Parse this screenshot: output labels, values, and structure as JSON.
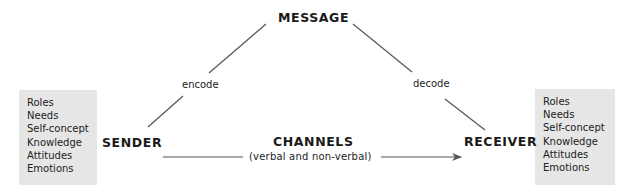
{
  "diagram": {
    "nodes": {
      "message": "MESSAGE",
      "sender": "SENDER",
      "receiver": "RECEIVER",
      "channels": "CHANNELS",
      "channels_subtitle": "(verbal and non-verbal)"
    },
    "edges": {
      "encode": "encode",
      "decode": "decode"
    },
    "sender_attributes": [
      "Roles",
      "Needs",
      "Self-concept",
      "Knowledge",
      "Attitudes",
      "Emotions"
    ],
    "receiver_attributes": [
      "Roles",
      "Needs",
      "Self-concept",
      "Knowledge",
      "Attitudes",
      "Emotions"
    ],
    "colors": {
      "box_fill": "#e6e6e6",
      "line": "#555555",
      "text": "#1a1a1a"
    }
  }
}
